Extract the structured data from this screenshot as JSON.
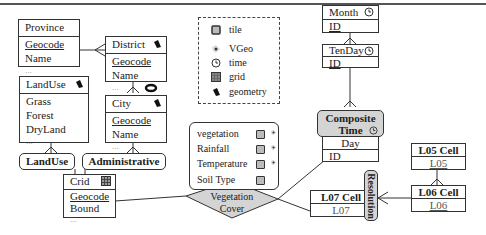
{
  "entities": {
    "province": {
      "title": "Province",
      "attrs": [
        "Geocode",
        "Name",
        "..."
      ]
    },
    "district": {
      "title": "District",
      "icon": "geometry-icon",
      "attrs": [
        "Geocode",
        "Name",
        "..."
      ]
    },
    "city": {
      "title": "City",
      "icon": "geometry-icon",
      "attrs": [
        "Geocode",
        "Name",
        "..."
      ]
    },
    "landuse": {
      "title": "LandUse",
      "icon": "geometry-icon",
      "attrs": [
        "Grass",
        "Forest",
        "DryLand",
        "..."
      ]
    },
    "grid": {
      "title": "Crid",
      "icon": "grid-icon",
      "attrs": [
        "Geocode",
        "Bound",
        "..."
      ]
    },
    "month": {
      "title": "Month",
      "icon": "time-icon",
      "attrs": [
        "ID"
      ]
    },
    "tenday": {
      "title": "TenDay",
      "icon": "time-icon",
      "attrs": [
        "ID"
      ]
    },
    "composite_time": {
      "title_line1": "Composite",
      "title_line2": "Time",
      "icon": "time-icon",
      "attrs": [
        "Day",
        "ID"
      ]
    },
    "l05": {
      "title": "L05 Cell",
      "attrs": [
        "L05"
      ]
    },
    "l06": {
      "title": "L06 Cell",
      "attrs": [
        "L06"
      ]
    },
    "l07": {
      "title": "L07 Cell",
      "attrs": [
        "L07"
      ]
    }
  },
  "hierarchies": {
    "landuse": "LandUse",
    "administrative": "Administrative",
    "resolution": "Resolution"
  },
  "fact": {
    "name_line1": "Vegetation",
    "name_line2": "Cover",
    "measures": [
      {
        "label": "vegetation",
        "tile": true,
        "vgeo": true
      },
      {
        "label": "Rainfall",
        "tile": true,
        "vgeo": true
      },
      {
        "label": "Temperature",
        "tile": true,
        "vgeo": true
      },
      {
        "label": "Soil Type",
        "tile": true,
        "vgeo": false
      }
    ]
  },
  "legend": {
    "items": [
      {
        "icon": "tile-icon",
        "label": "tile"
      },
      {
        "icon": "vgeo-icon",
        "label": "VGeo"
      },
      {
        "icon": "time-icon",
        "label": "time"
      },
      {
        "icon": "grid-icon",
        "label": "grid"
      },
      {
        "icon": "geometry-icon",
        "label": "geometry"
      }
    ]
  },
  "colors": {
    "fact_fill": "#d4d4d4",
    "composite_fill": "#d4d4d4",
    "line": "#333333"
  }
}
